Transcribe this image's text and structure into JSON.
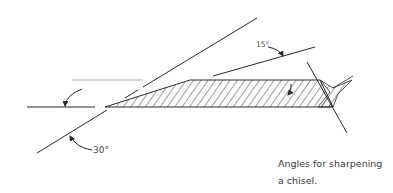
{
  "figure": {
    "type": "technical-illustration",
    "angle_labels": {
      "primary_bevel": "30°",
      "secondary_bevel": "15°"
    },
    "caption": {
      "line1": "Angles for sharpening",
      "line2": "a chisel."
    },
    "colors": {
      "line": "#2a2a2a",
      "text": "#3a3a3a",
      "background": "#ffffff"
    }
  }
}
